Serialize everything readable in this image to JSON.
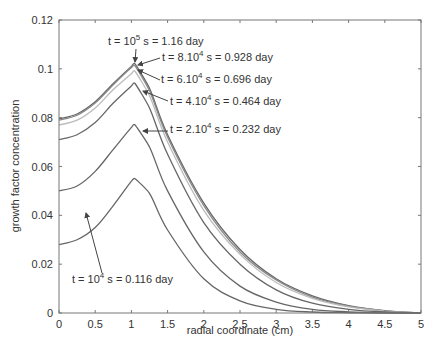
{
  "chart_data": {
    "type": "line",
    "title": "",
    "xlabel": "radial coordinate (cm)",
    "ylabel": "growth factor concentration",
    "xlim": [
      0,
      5
    ],
    "ylim": [
      0,
      0.12
    ],
    "x_ticks": [
      "0",
      "0.5",
      "1",
      "1.5",
      "2",
      "2.5",
      "3",
      "3.5",
      "4",
      "4.5",
      "5"
    ],
    "y_ticks": [
      "0",
      "0.02",
      "0.04",
      "0.06",
      "0.08",
      "0.1",
      "0.12"
    ],
    "grid": false,
    "legend": "none (curves labelled by arrow annotations)",
    "x": [
      0,
      0.25,
      0.5,
      0.75,
      1.0,
      1.05,
      1.25,
      1.5,
      2.0,
      2.5,
      3.0,
      3.5,
      4.0,
      4.5,
      5.0
    ],
    "series": [
      {
        "name": "t = 10^5 s = 1.16 day",
        "color": "#666666",
        "values": [
          0.0795,
          0.0815,
          0.0865,
          0.094,
          0.101,
          0.102,
          0.092,
          0.073,
          0.045,
          0.026,
          0.014,
          0.007,
          0.003,
          0.001,
          0.0
        ]
      },
      {
        "name": "t = 8.10^4 s = 0.928 day",
        "color": "#888888",
        "values": [
          0.079,
          0.081,
          0.086,
          0.0935,
          0.1005,
          0.1012,
          0.091,
          0.072,
          0.044,
          0.025,
          0.0135,
          0.0065,
          0.0028,
          0.0009,
          0.0
        ]
      },
      {
        "name": "t = 6.10^4 s = 0.696 day",
        "color": "#bbbbbb",
        "values": [
          0.077,
          0.079,
          0.084,
          0.0915,
          0.098,
          0.099,
          0.089,
          0.07,
          0.042,
          0.024,
          0.0125,
          0.006,
          0.0025,
          0.0008,
          0.0
        ]
      },
      {
        "name": "t = 4.10^4 s = 0.464 day",
        "color": "#666666",
        "values": [
          0.071,
          0.073,
          0.078,
          0.086,
          0.093,
          0.094,
          0.084,
          0.065,
          0.037,
          0.02,
          0.0095,
          0.004,
          0.0015,
          0.0004,
          0.0
        ]
      },
      {
        "name": "t = 2.10^4 s = 0.232 day",
        "color": "#666666",
        "values": [
          0.05,
          0.052,
          0.058,
          0.067,
          0.076,
          0.077,
          0.068,
          0.05,
          0.025,
          0.011,
          0.0045,
          0.0015,
          0.0005,
          0.0001,
          0.0
        ]
      },
      {
        "name": "t = 10^4 s = 0.116 day",
        "color": "#666666",
        "values": [
          0.028,
          0.03,
          0.035,
          0.044,
          0.054,
          0.055,
          0.049,
          0.034,
          0.014,
          0.005,
          0.0015,
          0.0004,
          0.0001,
          0.0,
          0.0
        ]
      }
    ],
    "annotations": [
      {
        "text": "t = 10^5 s = 1.16 day",
        "points_to": [
          1.05,
          0.102
        ]
      },
      {
        "text": "t = 8.10^4 s = 0.928 day",
        "points_to": [
          1.1,
          0.1005
        ]
      },
      {
        "text": "t = 6.10^4 s = 0.696 day",
        "points_to": [
          1.1,
          0.098
        ]
      },
      {
        "text": "t = 4.10^4 s = 0.464 day",
        "points_to": [
          1.22,
          0.093
        ]
      },
      {
        "text": "t = 2.10^4 s = 0.232 day",
        "points_to": [
          1.2,
          0.075
        ]
      },
      {
        "text": "t = 10^4 s = 0.116 day",
        "points_to": [
          0.62,
          0.038
        ]
      }
    ]
  },
  "labels": {
    "xlabel": "radial coordinate (cm)",
    "ylabel": "growth factor concentration",
    "annot": [
      {
        "pre": "t = 10",
        "sup": "5",
        "post": " s = 1.16 day"
      },
      {
        "pre": "t = 8.10",
        "sup": "4",
        "post": " s = 0.928 day"
      },
      {
        "pre": "t = 6.10",
        "sup": "4",
        "post": " s = 0.696 day"
      },
      {
        "pre": "t = 4.10",
        "sup": "4",
        "post": " s = 0.464 day"
      },
      {
        "pre": "t = 2.10",
        "sup": "4",
        "post": " s = 0.232 day"
      },
      {
        "pre": "t = 10",
        "sup": "4",
        "post": " s = 0.116 day"
      }
    ]
  }
}
